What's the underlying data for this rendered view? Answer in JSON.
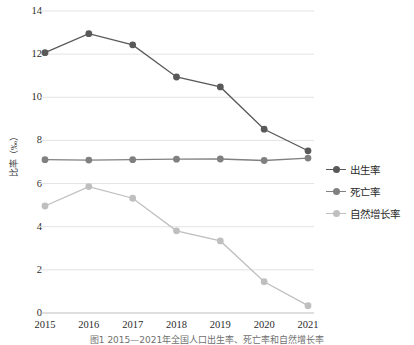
{
  "chart_data": {
    "type": "line",
    "title": "",
    "xlabel": "",
    "ylabel": "比率（‰）",
    "categories": [
      "2015",
      "2016",
      "2017",
      "2018",
      "2019",
      "2020",
      "2021"
    ],
    "ylim": [
      0,
      14
    ],
    "yticks": [
      0,
      2,
      4,
      6,
      8,
      10,
      12,
      14
    ],
    "grid": true,
    "legend_position": "right",
    "series": [
      {
        "name": "出生率",
        "color": "#595959",
        "values": [
          12.07,
          12.95,
          12.43,
          10.94,
          10.48,
          8.52,
          7.52
        ]
      },
      {
        "name": "死亡率",
        "color": "#808080",
        "values": [
          7.11,
          7.09,
          7.11,
          7.13,
          7.14,
          7.07,
          7.18
        ]
      },
      {
        "name": "自然增长率",
        "color": "#bfbfbf",
        "values": [
          4.96,
          5.86,
          5.32,
          3.81,
          3.34,
          1.45,
          0.34
        ]
      }
    ]
  },
  "caption": {
    "text": "图1  2015—2021年全国人口出生率、死亡率和自然增长率"
  },
  "colors": {
    "grid": "#e3e3e3",
    "axis": "#bfbfbf",
    "tick_text": "#2b2b2b"
  }
}
